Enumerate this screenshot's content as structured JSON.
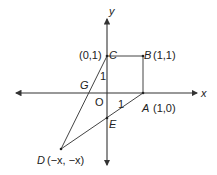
{
  "diagram": {
    "axes": {
      "x_label": "x",
      "y_label": "y"
    },
    "points": {
      "O": {
        "name": "O",
        "coord_label": ""
      },
      "A": {
        "name": "A",
        "coord_label": "(1,0)"
      },
      "B": {
        "name": "B",
        "coord_label": "(1,1)"
      },
      "C": {
        "name": "C",
        "coord_label": "(0,1)"
      },
      "D": {
        "name": "D",
        "coord_label": "(−x, −x)"
      },
      "E": {
        "name": "E",
        "coord_label": ""
      },
      "G": {
        "name": "G",
        "coord_label": ""
      }
    },
    "segment_labels": {
      "OC": "1",
      "OA": "1"
    },
    "segments": [
      "O-A",
      "A-B",
      "B-C",
      "C-O",
      "C-D",
      "D-A"
    ],
    "colors": {
      "line": "#444444",
      "text": "#222222",
      "background": "#ffffff"
    }
  }
}
